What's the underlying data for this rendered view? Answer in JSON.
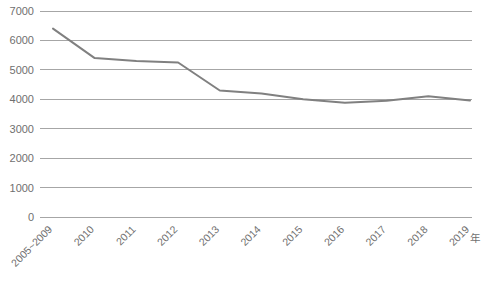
{
  "chart_data": {
    "type": "line",
    "title": "",
    "subtitle": "",
    "xlabel": "年",
    "ylabel": "",
    "categories": [
      "2005~2009",
      "2010",
      "2011",
      "2012",
      "2013",
      "2014",
      "2015",
      "2016",
      "2017",
      "2018",
      "2019"
    ],
    "series": [
      {
        "name": "",
        "values": [
          6400,
          5400,
          5300,
          5250,
          4300,
          4200,
          4000,
          3880,
          3950,
          4100,
          3960
        ],
        "color": "#808080"
      }
    ],
    "ylim": [
      0,
      7000
    ],
    "ytick_labels": [
      "7000",
      "6000",
      "5000",
      "4000",
      "3000",
      "2000",
      "1000",
      "0"
    ],
    "ytick_values": [
      7000,
      6000,
      5000,
      4000,
      3000,
      2000,
      1000,
      0
    ],
    "grid": true,
    "grid_color": "#a6a6a6",
    "legend": "none",
    "xtick_rotation": 45
  },
  "footnote": {
    "text": ""
  }
}
